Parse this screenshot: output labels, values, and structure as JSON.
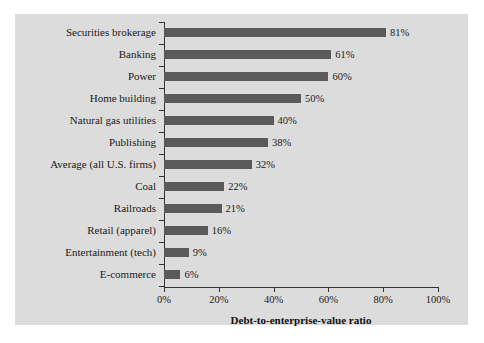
{
  "chart_data": {
    "type": "bar",
    "orientation": "horizontal",
    "title": "",
    "xlabel": "Debt-to-enterprise-value ratio",
    "ylabel": "",
    "xlim": [
      0,
      100
    ],
    "grid": false,
    "legend": null,
    "x_tick_labels": [
      "0%",
      "20%",
      "40%",
      "60%",
      "80%",
      "100%"
    ],
    "x_ticks": [
      0,
      20,
      40,
      60,
      80,
      100
    ],
    "categories": [
      "Securities brokerage",
      "Banking",
      "Power",
      "Home building",
      "Natural gas utilities",
      "Publishing",
      "Average (all U.S. firms)",
      "Coal",
      "Railroads",
      "Retail (apparel)",
      "Entertainment (tech)",
      "E-commerce"
    ],
    "values": [
      81,
      61,
      60,
      50,
      40,
      38,
      32,
      22,
      21,
      16,
      9,
      6
    ],
    "value_labels": [
      "81%",
      "61%",
      "60%",
      "50%",
      "40%",
      "38%",
      "32%",
      "22%",
      "21%",
      "16%",
      "9%",
      "6%"
    ]
  },
  "colors": {
    "bar": "#5a5a5a",
    "panel_background": "#dcdcdc",
    "figure_background": "#ffffff",
    "axis": "#333333",
    "text": "#1a1a1a"
  }
}
